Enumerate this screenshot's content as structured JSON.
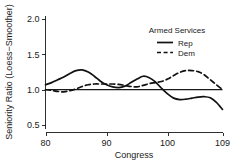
{
  "chart_data": {
    "type": "line",
    "title": "",
    "xlabel": "Congress",
    "ylabel": "Seniority Ratio (Loess−Smoother)",
    "xlim": [
      80,
      109
    ],
    "ylim": [
      0.45,
      2.05
    ],
    "xticks": [
      80,
      90,
      100,
      109
    ],
    "xtick_labels": [
      "80",
      "90",
      "100",
      "109"
    ],
    "yticks": [
      0.5,
      1.0,
      1.5,
      2.0
    ],
    "ytick_labels": [
      "0.5",
      "1.0",
      "1.5",
      "2.0"
    ],
    "grid": false,
    "reference_lines": [
      {
        "axis": "y",
        "value": 1.0,
        "style": "solid"
      }
    ],
    "legend": {
      "position": "upper-right",
      "title": "Armed Services",
      "entries": [
        {
          "name": "Rep",
          "style": "solid"
        },
        {
          "name": "Dem",
          "style": "dashed"
        }
      ]
    },
    "series": [
      {
        "name": "Rep",
        "style": "solid",
        "color": "#111111",
        "x": [
          80,
          81,
          82,
          83,
          84,
          85,
          86,
          87,
          88,
          89,
          90,
          91,
          92,
          93,
          94,
          95,
          96,
          97,
          98,
          99,
          100,
          101,
          102,
          103,
          104,
          105,
          106,
          107,
          108,
          109
        ],
        "y": [
          1.07,
          1.1,
          1.14,
          1.18,
          1.23,
          1.27,
          1.28,
          1.25,
          1.19,
          1.12,
          1.07,
          1.04,
          1.03,
          1.05,
          1.1,
          1.15,
          1.19,
          1.17,
          1.11,
          1.02,
          0.94,
          0.88,
          0.86,
          0.865,
          0.88,
          0.895,
          0.9,
          0.885,
          0.82,
          0.72
        ]
      },
      {
        "name": "Dem",
        "style": "dashed",
        "color": "#111111",
        "x": [
          80,
          81,
          82,
          83,
          84,
          85,
          86,
          87,
          88,
          89,
          90,
          91,
          92,
          93,
          94,
          95,
          96,
          97,
          98,
          99,
          100,
          101,
          102,
          103,
          104,
          105,
          106,
          107,
          108,
          109
        ],
        "y": [
          1.0,
          0.99,
          0.975,
          0.97,
          0.985,
          1.01,
          1.045,
          1.07,
          1.08,
          1.08,
          1.08,
          1.08,
          1.075,
          1.06,
          1.045,
          1.04,
          1.06,
          1.085,
          1.1,
          1.115,
          1.15,
          1.2,
          1.245,
          1.27,
          1.27,
          1.255,
          1.21,
          1.14,
          1.07,
          1.0
        ]
      }
    ]
  }
}
